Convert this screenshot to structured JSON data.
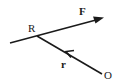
{
  "diagram": {
    "type": "vector-diagram",
    "labels": {
      "point_r": "R",
      "force": "F",
      "position_vector": "r",
      "origin": "O"
    },
    "elements": [
      {
        "name": "line-of-action",
        "from": "left",
        "through": "R",
        "to": "F",
        "arrow": "end"
      },
      {
        "name": "position-vector",
        "from": "O",
        "to": "R",
        "arrow": "middle"
      }
    ],
    "colors": {
      "stroke": "#1a1a1a",
      "background": "#ffffff"
    }
  }
}
